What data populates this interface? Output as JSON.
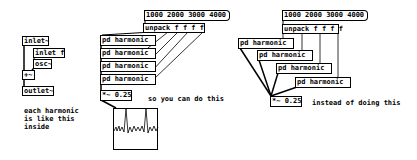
{
  "left": {
    "objects": [
      "inlet~",
      "inlet f",
      "osc~",
      "+~",
      "outlet~"
    ],
    "comment": "each harmonic\nis like this\ninside"
  },
  "middle": {
    "message": "1000 2000 3000 4000",
    "unpack": "unpack f f f f",
    "harmonics": [
      "pd harmonic",
      "pd harmonic",
      "pd harmonic",
      "pd harmonic"
    ],
    "multiply": "*~ 0.25",
    "comment": "so you can do this"
  },
  "right": {
    "message": "1000 2000 3000 4000",
    "unpack": "unpack f f f f",
    "harmonics": [
      "pd harmonic",
      "pd harmonic",
      "pd harmonic",
      "pd harmonic"
    ],
    "multiply": "*~ 0.25",
    "comment": "instead of doing this"
  }
}
